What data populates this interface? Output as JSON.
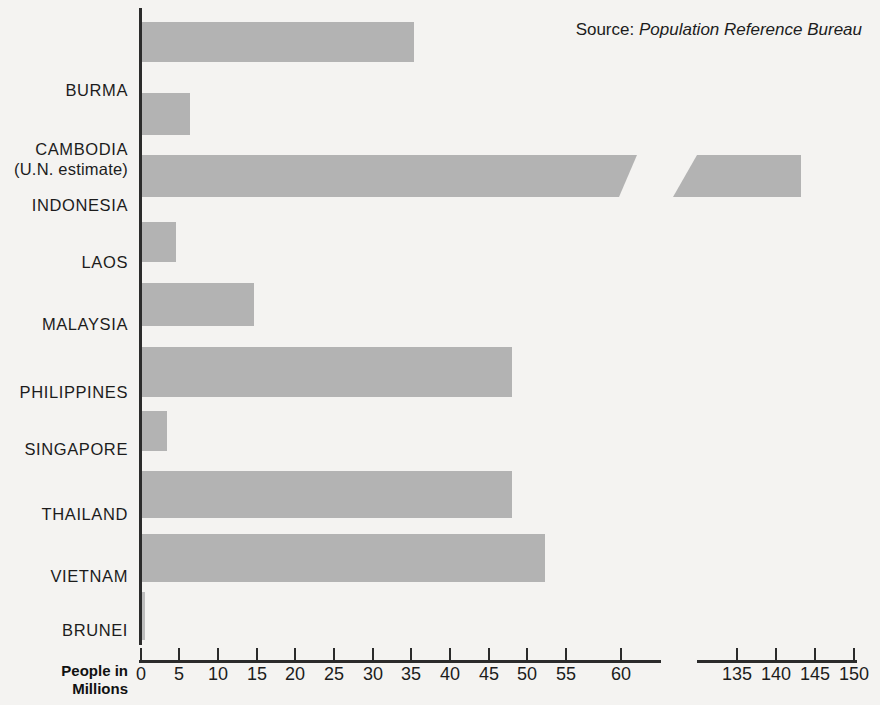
{
  "source": {
    "label": "Source:",
    "value": "Population Reference Bureau"
  },
  "axis": {
    "caption_line1": "People in",
    "caption_line2": "Millions"
  },
  "chart_data": {
    "type": "bar",
    "orientation": "horizontal",
    "title": "",
    "xlabel": "People in Millions",
    "ylabel": "",
    "grid": false,
    "legend": false,
    "axis_break": true,
    "xlim": [
      0,
      150
    ],
    "x_segments": [
      {
        "from": 0,
        "to": 60,
        "ticks": [
          0,
          5,
          10,
          15,
          20,
          25,
          30,
          35,
          40,
          45,
          50,
          55,
          60
        ]
      },
      {
        "from": 135,
        "to": 150,
        "ticks": [
          135,
          140,
          145,
          150
        ]
      }
    ],
    "tick_labels": [
      "0",
      "5",
      "10",
      "15",
      "20",
      "25",
      "30",
      "35",
      "40",
      "45",
      "50",
      "55",
      "60",
      "135",
      "140",
      "145",
      "150"
    ],
    "categories": [
      "BURMA",
      "CAMBODIA (U.N. estimate)",
      "INDONESIA",
      "LAOS",
      "MALAYSIA",
      "PHILIPPINES",
      "SINGAPORE",
      "THAILAND",
      "VIETNAM",
      "BRUNEI"
    ],
    "values": [
      35.3,
      6.4,
      143,
      4.5,
      14.6,
      48,
      3.4,
      48,
      52,
      0.2
    ],
    "annotations": [
      "Source: Population Reference Bureau"
    ]
  },
  "rows": [
    {
      "name": "burma",
      "label": "BURMA",
      "sub": "",
      "value": 35.3,
      "top": 80,
      "bar_top": 22,
      "bar_left": 142,
      "bar_width": 272,
      "bar_height": 40,
      "broken": false
    },
    {
      "name": "cambodia",
      "label": "CAMBODIA",
      "sub": "(U.N. estimate)",
      "value": 6.4,
      "top": 139,
      "bar_top": 93,
      "bar_left": 142,
      "bar_width": 48,
      "bar_height": 42,
      "broken": false
    },
    {
      "name": "indonesia",
      "label": "INDONESIA",
      "sub": "",
      "value": 143,
      "top": 195,
      "bar_top": 155,
      "bar_left": 142,
      "bar_width": 495,
      "bar_height": 42,
      "broken": true,
      "seg2_left": 673,
      "seg2_width": 128
    },
    {
      "name": "laos",
      "label": "LAOS",
      "sub": "",
      "value": 4.5,
      "top": 252,
      "bar_top": 222,
      "bar_left": 142,
      "bar_width": 34,
      "bar_height": 40,
      "broken": false
    },
    {
      "name": "malaysia",
      "label": "MALAYSIA",
      "sub": "",
      "value": 14.6,
      "top": 314,
      "bar_top": 283,
      "bar_left": 142,
      "bar_width": 112,
      "bar_height": 43,
      "broken": false
    },
    {
      "name": "philippines",
      "label": "PHILIPPINES",
      "sub": "",
      "value": 48,
      "top": 382,
      "bar_top": 347,
      "bar_left": 142,
      "bar_width": 370,
      "bar_height": 50,
      "broken": false
    },
    {
      "name": "singapore",
      "label": "SINGAPORE",
      "sub": "",
      "value": 3.4,
      "top": 439,
      "bar_top": 411,
      "bar_left": 142,
      "bar_width": 25,
      "bar_height": 40,
      "broken": false
    },
    {
      "name": "thailand",
      "label": "THAILAND",
      "sub": "",
      "value": 48,
      "top": 504,
      "bar_top": 471,
      "bar_left": 142,
      "bar_width": 370,
      "bar_height": 47,
      "broken": false
    },
    {
      "name": "vietnam",
      "label": "VIETNAM",
      "sub": "",
      "value": 52,
      "top": 566,
      "bar_top": 534,
      "bar_left": 142,
      "bar_width": 403,
      "bar_height": 48,
      "broken": false
    },
    {
      "name": "brunei",
      "label": "BRUNEI",
      "sub": "",
      "value": 0.2,
      "top": 620,
      "bar_top": 592,
      "bar_left": 142,
      "bar_width": 3,
      "bar_height": 48,
      "broken": false
    }
  ],
  "ticks_left": [
    {
      "label": "0",
      "x": 140
    },
    {
      "label": "5",
      "x": 178
    },
    {
      "label": "10",
      "x": 217
    },
    {
      "label": "15",
      "x": 256
    },
    {
      "label": "20",
      "x": 294
    },
    {
      "label": "25",
      "x": 333
    },
    {
      "label": "30",
      "x": 372
    },
    {
      "label": "35",
      "x": 410
    },
    {
      "label": "40",
      "x": 449
    },
    {
      "label": "45",
      "x": 488
    },
    {
      "label": "50",
      "x": 526
    },
    {
      "label": "55",
      "x": 565
    },
    {
      "label": "60",
      "x": 620
    }
  ],
  "ticks_right": [
    {
      "label": "135",
      "x": 736
    },
    {
      "label": "140",
      "x": 775
    },
    {
      "label": "145",
      "x": 814
    },
    {
      "label": "150",
      "x": 853
    }
  ]
}
